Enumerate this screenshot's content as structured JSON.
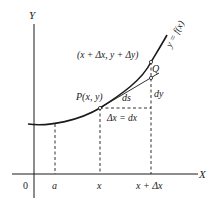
{
  "diagram": {
    "axes": {
      "y_label": "Y",
      "x_label": "X",
      "origin_label": "0"
    },
    "ticks": {
      "a": "a",
      "x": "x",
      "x_plus_dx": "x + Δx"
    },
    "points": {
      "upper_point_label": "(x + Δx, y + Δy)",
      "q_label": "Q",
      "p_label": "P(x, y)"
    },
    "segments": {
      "ds_label": "ds",
      "dy_label": "dy",
      "dx_label": "Δx = dx"
    },
    "curve_label": "y = f(x)",
    "colors": {
      "ink": "#1a1a1a",
      "background": "#ffffff"
    }
  }
}
